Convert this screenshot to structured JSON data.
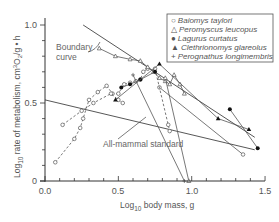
{
  "chart_data": {
    "type": "line",
    "title": "",
    "xlabel": "Log10 body mass, g",
    "xlabel_main": "Log",
    "xlabel_sub": "10",
    "xlabel_rest": " body mass, g",
    "ylabel": "Log10 rate of metabolism, cm3O2/g·h",
    "ylabel_main": "Log",
    "ylabel_sub": "10",
    "ylabel_rest": " rate of metabolism, cm",
    "ylabel_sup": "3",
    "ylabel_o2": "O",
    "ylabel_o2sub": "2",
    "ylabel_tail": "/g • h",
    "xlim": [
      0.0,
      1.5
    ],
    "ylim": [
      0.0,
      1.0
    ],
    "x_ticks": [
      "0.0",
      "0.5",
      "1.0",
      "1.5"
    ],
    "y_ticks": [
      "0",
      "0.5",
      "1.0"
    ],
    "grid": false,
    "legend_position": "upper right",
    "annotations": [
      {
        "text": "Boundary",
        "text2": "curve",
        "target": "boundary curve"
      },
      {
        "text": "All-mammal standard",
        "target": "all-mammal standard line"
      }
    ],
    "reference_lines": [
      {
        "name": "Boundary curve",
        "x": [
          0.26,
          1.43
        ],
        "y": [
          1.0,
          0.28
        ]
      },
      {
        "name": "All-mammal standard",
        "x": [
          0.0,
          1.43
        ],
        "y": [
          0.52,
          0.2
        ]
      }
    ],
    "series": [
      {
        "name": "Baiomys taylori",
        "marker": "open-circle",
        "segments": [
          {
            "style": "dashed",
            "x": [
              0.07,
              0.2,
              0.24,
              0.26,
              0.3,
              0.36,
              0.42,
              0.46,
              0.5,
              0.54,
              0.58,
              0.62,
              0.65,
              0.67,
              0.7
            ],
            "y": [
              0.12,
              0.27,
              0.34,
              0.4,
              0.52,
              0.57,
              0.61,
              0.56,
              0.56,
              0.62,
              0.63,
              0.64,
              0.65,
              0.7,
              0.72
            ]
          },
          {
            "style": "dashed",
            "x": [
              0.12,
              0.25,
              0.33,
              0.45,
              0.5,
              0.53
            ],
            "y": [
              0.36,
              0.45,
              0.5,
              0.56,
              0.52,
              0.5
            ]
          },
          {
            "style": "solid",
            "x": [
              0.78,
              1.35
            ],
            "y": [
              0.6,
              0.17
            ]
          },
          {
            "style": "dashed",
            "x": [
              0.75,
              0.84,
              0.85
            ],
            "y": [
              0.72,
              0.36,
              0.32
            ]
          }
        ]
      },
      {
        "name": "Peromyscus leucopus",
        "marker": "open-triangle",
        "segments": [
          {
            "style": "solid",
            "x": [
              0.37,
              0.48,
              0.58,
              0.65,
              0.7,
              0.74,
              0.78,
              0.82,
              0.85,
              0.88,
              0.92,
              0.95
            ],
            "y": [
              0.85,
              0.8,
              0.78,
              0.77,
              0.73,
              0.7,
              0.66,
              0.64,
              0.62,
              0.68,
              0.62,
              0.56
            ]
          },
          {
            "style": "solid",
            "x": [
              0.82,
              0.98
            ],
            "y": [
              0.66,
              0.0
            ]
          }
        ]
      },
      {
        "name": "Lagurus curtatus",
        "marker": "filled-circle",
        "segments": [
          {
            "style": "solid",
            "x": [
              0.52,
              0.58,
              0.65,
              0.75
            ],
            "y": [
              0.6,
              0.62,
              0.65,
              0.7
            ]
          },
          {
            "style": "solid",
            "x": [
              1.26,
              1.45
            ],
            "y": [
              0.46,
              0.21
            ]
          }
        ]
      },
      {
        "name": "Clethrionomys glareolus",
        "marker": "filled-triangle",
        "segments": [
          {
            "style": "solid",
            "x": [
              0.48,
              0.78,
              1.18,
              1.39
            ],
            "y": [
              0.52,
              0.75,
              0.4,
              0.33
            ]
          }
        ]
      },
      {
        "name": "Perognathus longimembris",
        "marker": "plus",
        "segments": [
          {
            "style": "solid",
            "x": [
              0.6,
              0.95
            ],
            "y": [
              0.68,
              0.0
            ]
          }
        ]
      }
    ]
  },
  "legend": {
    "items": [
      {
        "symbol": "○",
        "label": "Baiomys taylori"
      },
      {
        "symbol": "△",
        "label": "Peromyscus leucopus"
      },
      {
        "symbol": "●",
        "label": "Lagurus curtatus"
      },
      {
        "symbol": "▲",
        "label": "Clethrionomys glareolus"
      },
      {
        "symbol": "+",
        "label": "Perognathus longimembris"
      }
    ]
  }
}
